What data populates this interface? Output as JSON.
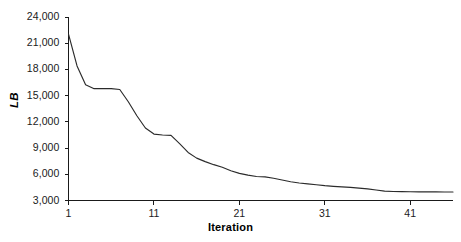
{
  "chart_data": {
    "type": "line",
    "title": "",
    "subtitle": "",
    "xlabel": "Iteration",
    "ylabel": "LB",
    "xlim": [
      1,
      46
    ],
    "ylim": [
      3000,
      24000
    ],
    "grid": false,
    "legend": null,
    "legend_position": "none",
    "xticks": [
      1,
      11,
      21,
      31,
      41
    ],
    "xtick_labels": [
      "1",
      "11",
      "21",
      "31",
      "41"
    ],
    "yticks": [
      3000,
      6000,
      9000,
      12000,
      15000,
      18000,
      21000,
      24000
    ],
    "ytick_labels": [
      "3,000",
      "6,000",
      "9,000",
      "12,000",
      "15,000",
      "18,000",
      "21,000",
      "24,000"
    ],
    "line_color": "#2b2b2b",
    "axis_color": "#1a1a1a",
    "background_color": "#ffffff",
    "series": [
      {
        "name": "LB",
        "x": [
          1,
          2,
          3,
          4,
          5,
          6,
          7,
          8,
          9,
          10,
          11,
          12,
          13,
          14,
          15,
          16,
          17,
          18,
          19,
          20,
          21,
          22,
          23,
          24,
          25,
          26,
          27,
          28,
          29,
          30,
          31,
          32,
          33,
          34,
          35,
          36,
          37,
          38,
          39,
          40,
          41,
          42,
          43,
          44,
          45,
          46
        ],
        "values": [
          22050,
          18400,
          16250,
          15800,
          15800,
          15800,
          15700,
          14300,
          12700,
          11300,
          10600,
          10500,
          10450,
          9500,
          8500,
          7850,
          7450,
          7100,
          6800,
          6400,
          6100,
          5900,
          5750,
          5700,
          5550,
          5350,
          5150,
          5000,
          4900,
          4800,
          4700,
          4620,
          4560,
          4500,
          4420,
          4330,
          4200,
          4080,
          4030,
          4010,
          4000,
          3990,
          3985,
          3980,
          3975,
          3970
        ]
      }
    ],
    "annotations": []
  },
  "axes": {
    "y_label_text": "LB",
    "x_label_text": "Iteration"
  }
}
